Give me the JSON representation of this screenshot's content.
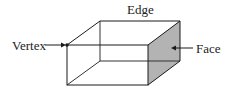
{
  "diagram": {
    "type": "rectangular-prism",
    "labels": {
      "edge": "Edge",
      "vertex": "Vertex",
      "face": "Face"
    },
    "colors": {
      "line": "#1a1a1a",
      "hidden_line": "#333333",
      "face_fill": "#b3b3b3",
      "text": "#222222"
    }
  }
}
